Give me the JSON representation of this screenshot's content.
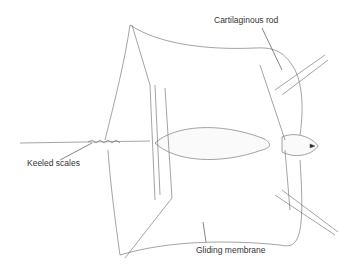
{
  "figure": {
    "labels": [
      {
        "id": "cartilaginous-rod",
        "text": "Cartilaginous rod"
      },
      {
        "id": "keeled-scales",
        "text": "Keeled scales"
      },
      {
        "id": "gliding-membrane",
        "text": "Gliding membrane"
      }
    ]
  },
  "colors": {
    "line": "#555555",
    "text": "#333333",
    "background": "#ffffff"
  }
}
